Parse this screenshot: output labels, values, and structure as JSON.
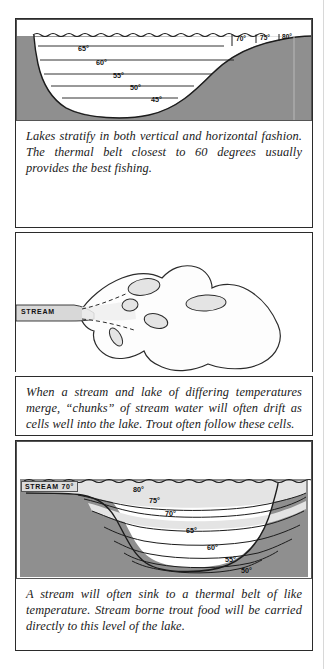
{
  "document": {
    "title": "Lake Thermal Stratification Diagrams",
    "page_background": "#ffffff",
    "ink_color": "#2b2b2b",
    "land_fill": "#8f8f8f",
    "water_fill": "#ffffff",
    "warm_band_fill": "#e8e8e8",
    "cell_fill": "#e4e4e4"
  },
  "panels": [
    {
      "id": "panel-1",
      "figure": {
        "name": "lake-cross-section-stratification",
        "type": "cross-section",
        "stream_label": null,
        "temperature_labels": [
          {
            "text": "65°",
            "x": 78,
            "y": 33
          },
          {
            "text": "60°",
            "x": 97,
            "y": 47
          },
          {
            "text": "55°",
            "x": 113,
            "y": 60
          },
          {
            "text": "50°",
            "x": 130,
            "y": 72
          },
          {
            "text": "45°",
            "x": 151,
            "y": 84
          }
        ],
        "surface_band_labels": [
          {
            "text": "70°",
            "x": 243,
            "y": 31
          },
          {
            "text": "75°",
            "x": 262,
            "y": 31
          },
          {
            "text": "80°",
            "x": 281,
            "y": 31
          }
        ]
      },
      "caption": "Lakes stratify in both vertical and horizontal fashion. The thermal belt closest to 60 degrees usually provides the best fishing."
    },
    {
      "id": "panel-2",
      "figure": {
        "name": "lake-plan-view-stream-cells",
        "type": "plan-view",
        "stream_label": "STREAM",
        "cells_count": 6,
        "temperature_labels": []
      },
      "caption": "When a stream and lake of differing temperatures merge, “chunks” of stream water will often drift as cells well into the lake. Trout often follow these cells."
    },
    {
      "id": "panel-3",
      "figure": {
        "name": "stream-sinking-thermal-belt",
        "type": "cross-section",
        "stream_label": "STREAM 70°",
        "temperature_labels": [
          {
            "text": "80°",
            "x": 132,
            "y": 489
          },
          {
            "text": "75°",
            "x": 148,
            "y": 500
          },
          {
            "text": "70°",
            "x": 164,
            "y": 513
          },
          {
            "text": "65°",
            "x": 185,
            "y": 530
          },
          {
            "text": "60°",
            "x": 206,
            "y": 547
          },
          {
            "text": "55°",
            "x": 224,
            "y": 559
          },
          {
            "text": "50°",
            "x": 240,
            "y": 570
          }
        ]
      },
      "caption": "A stream will often sink to a thermal belt of like temperature. Stream borne trout food will be carried directly to this level of the lake."
    }
  ]
}
